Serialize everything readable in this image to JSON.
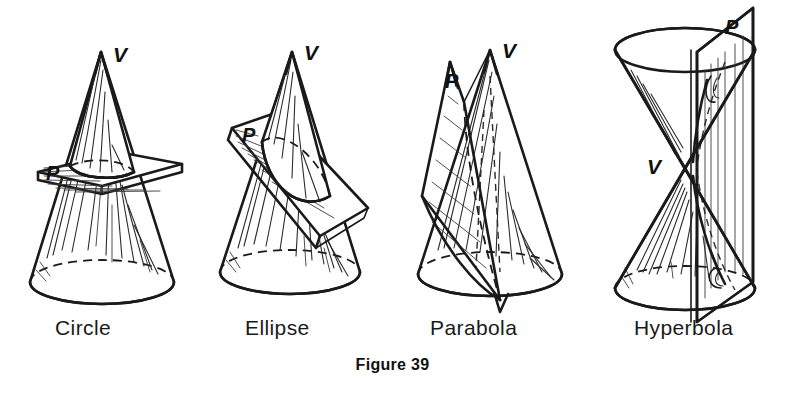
{
  "figure": {
    "caption": "Figure 39",
    "background_color": "#ffffff",
    "ink_color": "#1a1a1a",
    "panels": [
      {
        "id": "circle",
        "label": "Circle",
        "vertex_label": "V",
        "plane_label": "P",
        "description": "Cone with apex V cut by a horizontal plane P producing a circular section"
      },
      {
        "id": "ellipse",
        "label": "Ellipse",
        "vertex_label": "V",
        "plane_label": "P",
        "description": "Cone with apex V cut by an oblique plane P producing an elliptical section"
      },
      {
        "id": "parabola",
        "label": "Parabola",
        "vertex_label": "V",
        "plane_label": "P",
        "description": "Cone with apex V cut by a plane P parallel to a generator producing a parabolic section"
      },
      {
        "id": "hyperbola",
        "label": "Hyperbola",
        "vertex_label": "V",
        "plane_label": "P",
        "description": "Double cone with common vertex V cut by a vertical plane P producing a hyperbolic section"
      }
    ]
  }
}
